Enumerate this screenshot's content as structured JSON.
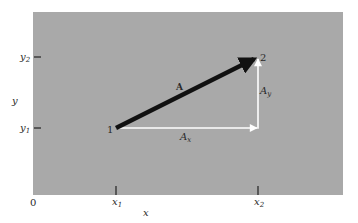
{
  "diagram": {
    "background_color": "#a9a9a9",
    "vector_color": "#111111",
    "component_color": "#ffffff",
    "points": [
      {
        "id": "1",
        "label": "1"
      },
      {
        "id": "2",
        "label": "2"
      }
    ],
    "vector": {
      "label": "A"
    },
    "components": {
      "x": {
        "label_main": "A",
        "label_sub": "x"
      },
      "y": {
        "label_main": "A",
        "label_sub": "y"
      }
    },
    "axes": {
      "origin": "0",
      "x_axis_label": "x",
      "y_axis_label": "y",
      "x_ticks": [
        {
          "main": "x",
          "sub": "1"
        },
        {
          "main": "x",
          "sub": "2"
        }
      ],
      "y_ticks": [
        {
          "main": "y",
          "sub": "2"
        },
        {
          "main": "y",
          "sub": "1"
        }
      ]
    }
  }
}
